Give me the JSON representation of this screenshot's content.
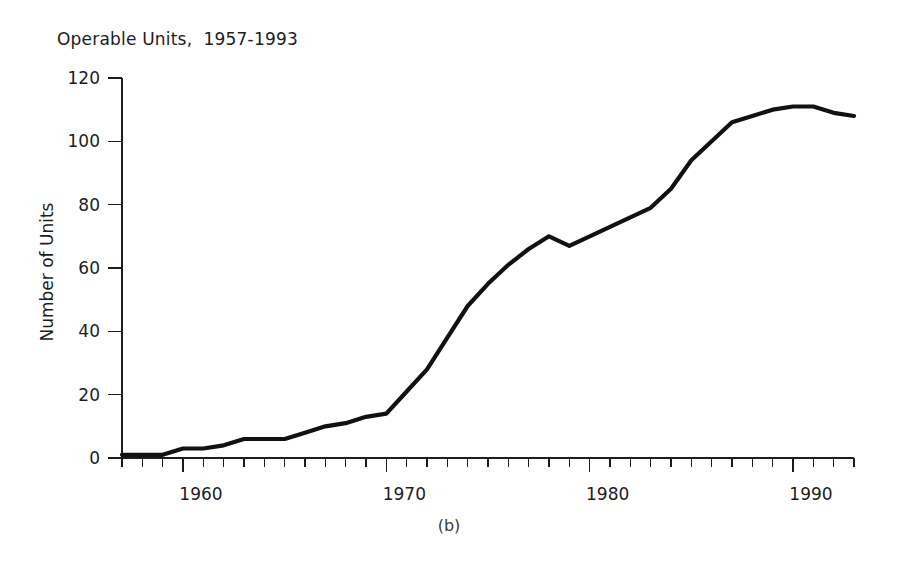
{
  "chart_data": {
    "type": "line",
    "title": "Operable Units,  1957-1993",
    "subtitle": "",
    "caption": "(b)",
    "xlabel": "",
    "ylabel": "Number of Units",
    "xlim": [
      1957,
      1993
    ],
    "ylim": [
      0,
      120
    ],
    "grid": false,
    "legend": false,
    "legend_position": "none",
    "y_ticks": [
      0,
      20,
      40,
      60,
      80,
      100,
      120
    ],
    "y_tick_labels": [
      "0",
      "20",
      "40",
      "60",
      "80",
      "100",
      "120"
    ],
    "x_ticks": [
      1960,
      1970,
      1980,
      1990
    ],
    "x_tick_labels": [
      "1960",
      "1970",
      "1980",
      "1990"
    ],
    "x_minor_tick_interval": 1,
    "line_color": "#111111",
    "series": [
      {
        "name": "Operable Units",
        "x": [
          1957,
          1958,
          1959,
          1960,
          1961,
          1962,
          1963,
          1964,
          1965,
          1966,
          1967,
          1968,
          1969,
          1970,
          1971,
          1972,
          1973,
          1974,
          1975,
          1976,
          1977,
          1978,
          1979,
          1980,
          1981,
          1982,
          1983,
          1984,
          1985,
          1986,
          1987,
          1988,
          1989,
          1990,
          1991,
          1992,
          1993
        ],
        "values": [
          1,
          1,
          1,
          3,
          3,
          4,
          6,
          6,
          6,
          8,
          10,
          11,
          13,
          14,
          21,
          28,
          38,
          48,
          55,
          61,
          66,
          70,
          67,
          70,
          73,
          76,
          79,
          85,
          94,
          100,
          106,
          108,
          110,
          111,
          111,
          109,
          108
        ]
      }
    ]
  }
}
